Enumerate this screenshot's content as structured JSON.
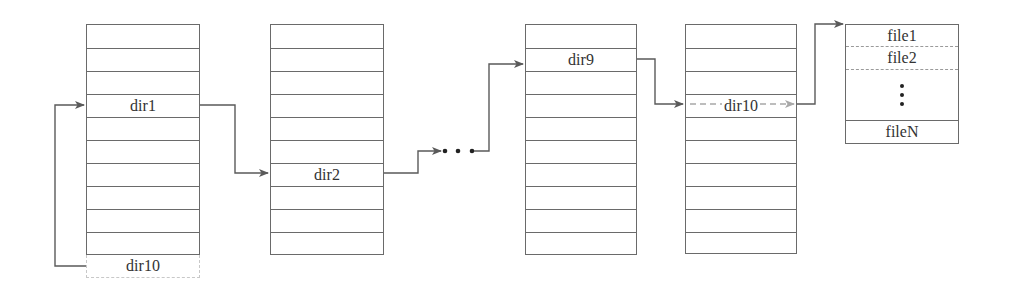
{
  "diagram": {
    "type": "directory-chain",
    "colors": {
      "line": "#5a5a5a",
      "border": "#6a6a6a",
      "dashed_arrow": "#a8a8a8",
      "text": "#333333"
    },
    "tables": [
      {
        "id": "table-1",
        "rows": 10,
        "entry_label": "dir1",
        "entry_row": 3,
        "overflow_label": "dir10"
      },
      {
        "id": "table-2",
        "rows": 10,
        "entry_label": "dir2",
        "entry_row": 6
      },
      {
        "id": "table-9",
        "rows": 10,
        "entry_label": "dir9",
        "entry_row": 1
      },
      {
        "id": "table-10",
        "rows": 10,
        "entry_label": "dir10",
        "entry_row": 3
      }
    ],
    "ellipsis": "• • •",
    "file_list": {
      "items": [
        "file1",
        "file2",
        "fileN"
      ],
      "ellipsis": "vertical-dots"
    },
    "connections": [
      {
        "from": "table-1.overflow(dir10)",
        "to": "table-1.dir1",
        "style": "solid"
      },
      {
        "from": "table-1.dir1",
        "to": "table-2.dir2",
        "style": "solid"
      },
      {
        "from": "table-2.dir2",
        "to": "ellipsis",
        "style": "solid"
      },
      {
        "from": "ellipsis",
        "to": "table-9.row0",
        "style": "solid"
      },
      {
        "from": "table-9.dir9",
        "to": "table-10.dir10",
        "style": "solid"
      },
      {
        "from": "table-10.dir10",
        "to": "table-10.right-edge",
        "style": "dashed"
      },
      {
        "from": "table-10.dir10",
        "to": "file_list",
        "style": "solid"
      }
    ]
  }
}
